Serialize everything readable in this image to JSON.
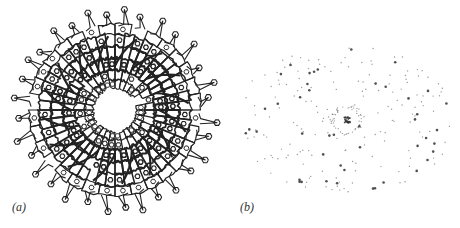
{
  "figure": {
    "panels": [
      {
        "id": "a",
        "label": "(a)",
        "description": "Top-down view of a ring-shaped molecular assembly with ~16-fold symmetry",
        "center": [
          115,
          110
        ],
        "outer_radius": 100,
        "inner_radius": 22,
        "symmetry": 16,
        "line_color": "#222222"
      },
      {
        "id": "b",
        "label": "(b)",
        "description": "Diffraction pattern of scattered spots around a dense central spot",
        "center": [
          117,
          120
        ],
        "spot_color": "#333333"
      }
    ]
  }
}
